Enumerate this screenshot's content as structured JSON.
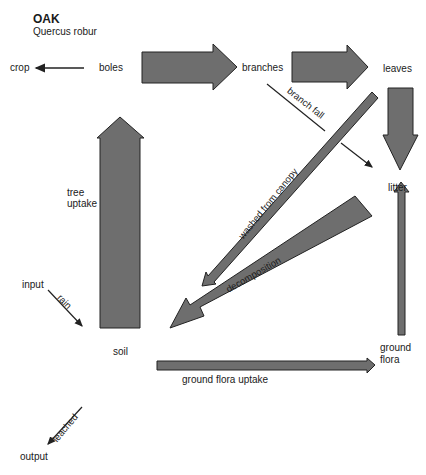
{
  "title": "OAK",
  "subtitle": "Quercus robur",
  "nodes": {
    "crop": "crop",
    "boles": "boles",
    "branches": "branches",
    "leaves": "leaves",
    "litter": "litter",
    "soil": "soil",
    "input": "input",
    "output": "output",
    "ground_flora_1": "ground",
    "ground_flora_2": "flora"
  },
  "flows": {
    "tree_uptake_1": "tree",
    "tree_uptake_2": "uptake",
    "branch_fall": "branch fall",
    "washed": "washed from canopy",
    "decomposition": "decomposition",
    "rain": "rain",
    "ground_flora_uptake": "ground flora uptake",
    "leached": "leached"
  },
  "colors": {
    "arrow_fill": "#6e6e6e",
    "arrow_stroke": "#222222"
  }
}
